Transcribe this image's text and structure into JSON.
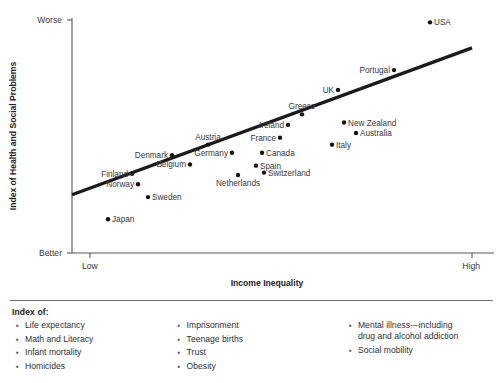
{
  "chart_data": {
    "type": "scatter",
    "title": "",
    "xlabel": "Income Inequality",
    "ylabel": "Index of Health and Social Problems",
    "x_tick_labels": [
      "Low",
      "High"
    ],
    "y_tick_labels": [
      "Worse",
      "Better"
    ],
    "y_axis_top_label": "Worse",
    "y_axis_bottom_label": "Better",
    "grid": false,
    "legend": "none",
    "xlim": [
      0,
      100
    ],
    "ylim": [
      0,
      100
    ],
    "trendline": {
      "label": "best-fit line",
      "x_start": 0,
      "y_start": 25,
      "x_end": 100,
      "y_end": 88
    },
    "points": [
      {
        "name": "USA",
        "x": 89.5,
        "y": 99.0,
        "label_side": "right"
      },
      {
        "name": "Portugal",
        "x": 80.5,
        "y": 78.5,
        "label_side": "left"
      },
      {
        "name": "UK",
        "x": 66.5,
        "y": 70.0,
        "label_side": "left"
      },
      {
        "name": "Greece",
        "x": 57.5,
        "y": 59.5,
        "label_side": "above"
      },
      {
        "name": "New Zealand",
        "x": 68.0,
        "y": 56.0,
        "label_side": "right"
      },
      {
        "name": "Ireland",
        "x": 54.0,
        "y": 55.0,
        "label_side": "left"
      },
      {
        "name": "Australia",
        "x": 71.0,
        "y": 51.5,
        "label_side": "right"
      },
      {
        "name": "Austria",
        "x": 34.0,
        "y": 46.5,
        "label_side": "above"
      },
      {
        "name": "France",
        "x": 52.0,
        "y": 49.5,
        "label_side": "left"
      },
      {
        "name": "Italy",
        "x": 65.0,
        "y": 46.5,
        "label_side": "right"
      },
      {
        "name": "Germany",
        "x": 40.0,
        "y": 43.0,
        "label_side": "left"
      },
      {
        "name": "Canada",
        "x": 47.5,
        "y": 43.0,
        "label_side": "right"
      },
      {
        "name": "Denmark",
        "x": 25.0,
        "y": 42.0,
        "label_side": "left"
      },
      {
        "name": "Belgium",
        "x": 29.5,
        "y": 38.0,
        "label_side": "left"
      },
      {
        "name": "Spain",
        "x": 46.0,
        "y": 37.5,
        "label_side": "right"
      },
      {
        "name": "Switzerland",
        "x": 48.0,
        "y": 34.5,
        "label_side": "right"
      },
      {
        "name": "Finland",
        "x": 15.0,
        "y": 34.0,
        "label_side": "left"
      },
      {
        "name": "Netherlands",
        "x": 41.5,
        "y": 33.5,
        "label_side": "below"
      },
      {
        "name": "Norway",
        "x": 16.5,
        "y": 29.5,
        "label_side": "left"
      },
      {
        "name": "Sweden",
        "x": 19.0,
        "y": 24.0,
        "label_side": "right"
      },
      {
        "name": "Japan",
        "x": 9.0,
        "y": 14.5,
        "label_side": "right"
      }
    ]
  },
  "footer": {
    "heading": "Index of:",
    "columns": [
      {
        "items": [
          "Life expectancy",
          "Math and Literacy",
          "Infant mortality",
          "Homicides"
        ]
      },
      {
        "items": [
          "Imprisonment",
          "Teenage births",
          "Trust",
          "Obesity"
        ]
      },
      {
        "items": [
          "Mental illness—including\ndrug and alcohol addiction",
          "Social mobility"
        ]
      }
    ],
    "bullet_glyph": "▪"
  }
}
